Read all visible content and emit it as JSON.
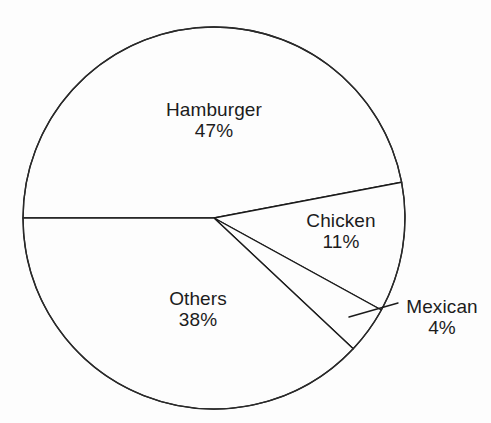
{
  "chart_data": {
    "type": "pie",
    "title": "",
    "subtitle": "",
    "xlabel": "",
    "ylabel": "",
    "legend_position": "none",
    "grid": false,
    "labels_inside": true,
    "total": 100,
    "units": "%",
    "categories": [
      "Hamburger",
      "Chicken",
      "Mexican",
      "Others"
    ],
    "values": [
      47,
      11,
      4,
      38
    ],
    "slices": [
      {
        "name": "Hamburger",
        "value": 47,
        "value_label": "47%",
        "label_placement": "inside",
        "start_angle_deg": 180,
        "end_angle_deg": 349.2
      },
      {
        "name": "Chicken",
        "value": 11,
        "value_label": "11%",
        "label_placement": "inside",
        "start_angle_deg": 349.2,
        "end_angle_deg": 388.8
      },
      {
        "name": "Mexican",
        "value": 4,
        "value_label": "4%",
        "label_placement": "outside-leader",
        "start_angle_deg": 388.8,
        "end_angle_deg": 403.2
      },
      {
        "name": "Others",
        "value": 38,
        "value_label": "38%",
        "label_placement": "inside",
        "start_angle_deg": 403.2,
        "end_angle_deg": 540
      }
    ]
  },
  "figure": {
    "background_color": "#fdfdfd",
    "line_color": "#1b1b1b",
    "text_color": "#1c1c1c",
    "geometry": {
      "center_x": 214,
      "center_y": 218,
      "radius": 191
    }
  },
  "labels": {
    "hamburger": {
      "name": "Hamburger",
      "value": "47%"
    },
    "chicken": {
      "name": "Chicken",
      "value": "11%"
    },
    "mexican": {
      "name": "Mexican",
      "value": "4%"
    },
    "others": {
      "name": "Others",
      "value": "38%"
    }
  }
}
